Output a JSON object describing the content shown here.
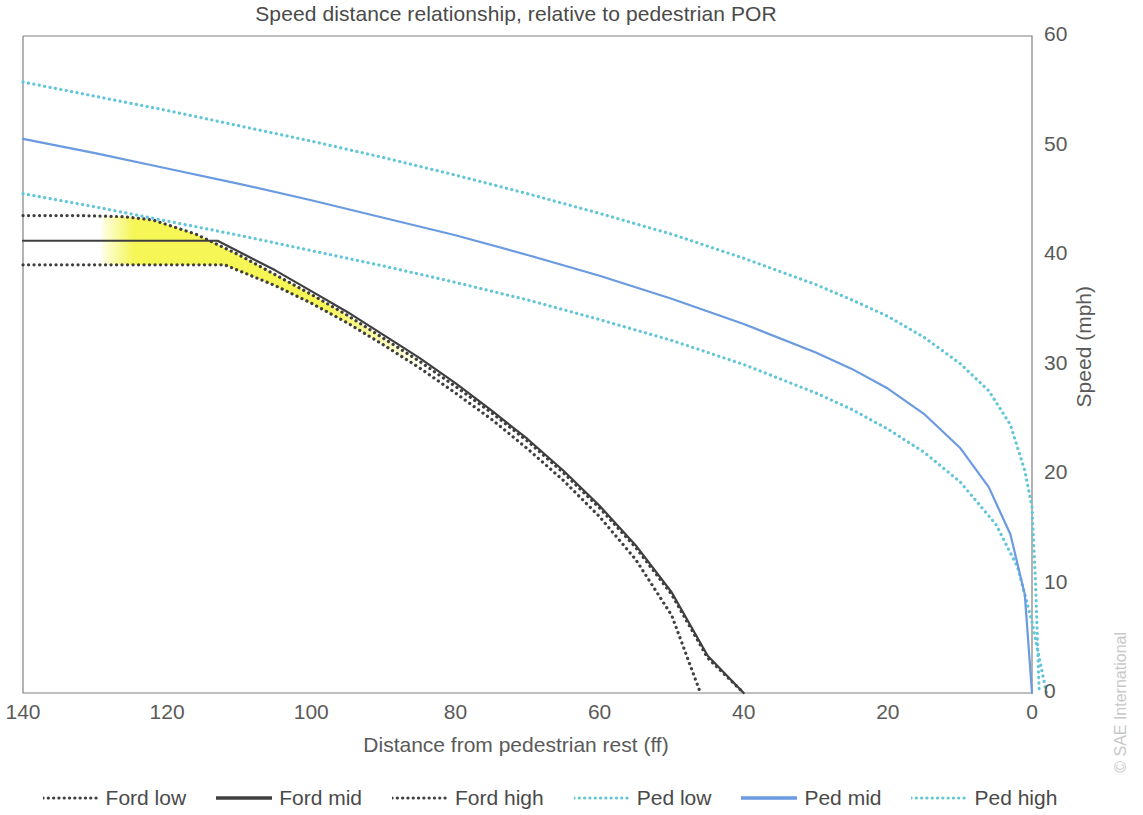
{
  "chart_data": {
    "type": "line",
    "title": "Speed distance relationship, relative to pedestrian POR",
    "xlabel": "Distance from pedestrian rest (ff)",
    "ylabel": "Speed (mph)",
    "xlim": [
      140,
      0
    ],
    "ylim": [
      0,
      60
    ],
    "x_ticks": [
      140,
      120,
      100,
      80,
      60,
      40,
      20,
      0
    ],
    "y_ticks": [
      0,
      10,
      20,
      30,
      40,
      50,
      60
    ],
    "x_axis_reversed": true,
    "grid": false,
    "legend_position": "bottom",
    "colors": {
      "ford": "#3f3f3f",
      "ped_mid": "#6a9ae0",
      "ped_bounds": "#62c6d8",
      "highlight_band": "#f5f54d",
      "axis": "#808080",
      "text": "#595959"
    },
    "highlight_band": {
      "label": "uncertainty-highlight",
      "color": "#f5f54d",
      "x_start": 129,
      "x_end": 85
    },
    "series": [
      {
        "name": "Ford low",
        "style": "dotted",
        "color": "#3f3f3f",
        "points": [
          [
            140,
            39.1
          ],
          [
            130,
            39.1
          ],
          [
            120,
            39.1
          ],
          [
            112,
            39.1
          ],
          [
            105,
            37.2
          ],
          [
            100,
            35.6
          ],
          [
            95,
            33.8
          ],
          [
            90,
            31.8
          ],
          [
            85,
            29.7
          ],
          [
            80,
            27.4
          ],
          [
            75,
            25.0
          ],
          [
            70,
            22.3
          ],
          [
            65,
            19.4
          ],
          [
            60,
            16.1
          ],
          [
            55,
            12.2
          ],
          [
            50,
            7.1
          ],
          [
            46,
            0
          ]
        ]
      },
      {
        "name": "Ford mid",
        "style": "solid",
        "color": "#3f3f3f",
        "points": [
          [
            140,
            41.3
          ],
          [
            130,
            41.3
          ],
          [
            122,
            41.3
          ],
          [
            113,
            41.3
          ],
          [
            105,
            38.6
          ],
          [
            100,
            36.7
          ],
          [
            95,
            34.8
          ],
          [
            90,
            32.7
          ],
          [
            85,
            30.6
          ],
          [
            80,
            28.3
          ],
          [
            75,
            25.8
          ],
          [
            70,
            23.2
          ],
          [
            65,
            20.3
          ],
          [
            60,
            17.1
          ],
          [
            55,
            13.5
          ],
          [
            50,
            9.2
          ],
          [
            45,
            3.4
          ],
          [
            40,
            0
          ]
        ]
      },
      {
        "name": "Ford high",
        "style": "dotted",
        "color": "#3f3f3f",
        "points": [
          [
            140,
            43.6
          ],
          [
            132,
            43.6
          ],
          [
            126,
            43.5
          ],
          [
            122,
            43.2
          ],
          [
            116,
            41.9
          ],
          [
            110,
            40.0
          ],
          [
            105,
            38.2
          ],
          [
            100,
            36.4
          ],
          [
            95,
            34.5
          ],
          [
            90,
            32.4
          ],
          [
            85,
            30.3
          ],
          [
            80,
            28.0
          ],
          [
            75,
            25.6
          ],
          [
            70,
            23.0
          ],
          [
            65,
            20.1
          ],
          [
            60,
            16.9
          ],
          [
            55,
            13.3
          ],
          [
            50,
            9.0
          ],
          [
            45,
            3.2
          ],
          [
            40,
            0
          ]
        ]
      },
      {
        "name": "Ped low",
        "style": "dotted",
        "color": "#62c6d8",
        "points": [
          [
            140,
            45.6
          ],
          [
            130,
            44.4
          ],
          [
            120,
            43.1
          ],
          [
            110,
            41.8
          ],
          [
            100,
            40.4
          ],
          [
            90,
            39.0
          ],
          [
            80,
            37.5
          ],
          [
            70,
            35.9
          ],
          [
            60,
            34.1
          ],
          [
            50,
            32.2
          ],
          [
            40,
            30.0
          ],
          [
            30,
            27.4
          ],
          [
            25,
            25.9
          ],
          [
            20,
            24.1
          ],
          [
            15,
            22.0
          ],
          [
            10,
            19.3
          ],
          [
            5,
            15.4
          ],
          [
            2,
            11.5
          ],
          [
            0,
            6.5
          ],
          [
            -2,
            0
          ]
        ]
      },
      {
        "name": "Ped mid",
        "style": "solid",
        "color": "#6a9ae0",
        "points": [
          [
            140,
            50.6
          ],
          [
            130,
            49.3
          ],
          [
            120,
            47.9
          ],
          [
            110,
            46.5
          ],
          [
            100,
            45.0
          ],
          [
            90,
            43.4
          ],
          [
            80,
            41.8
          ],
          [
            70,
            40.0
          ],
          [
            60,
            38.1
          ],
          [
            50,
            36.0
          ],
          [
            40,
            33.7
          ],
          [
            30,
            31.1
          ],
          [
            25,
            29.6
          ],
          [
            20,
            27.8
          ],
          [
            15,
            25.5
          ],
          [
            10,
            22.4
          ],
          [
            6,
            18.8
          ],
          [
            3,
            14.5
          ],
          [
            1,
            9.0
          ],
          [
            0,
            0
          ]
        ]
      },
      {
        "name": "Ped high",
        "style": "dotted",
        "color": "#62c6d8",
        "points": [
          [
            140,
            55.8
          ],
          [
            130,
            54.5
          ],
          [
            120,
            53.2
          ],
          [
            110,
            51.8
          ],
          [
            100,
            50.4
          ],
          [
            90,
            48.9
          ],
          [
            80,
            47.3
          ],
          [
            70,
            45.6
          ],
          [
            60,
            43.8
          ],
          [
            50,
            41.9
          ],
          [
            40,
            39.7
          ],
          [
            30,
            37.3
          ],
          [
            25,
            35.9
          ],
          [
            20,
            34.4
          ],
          [
            15,
            32.5
          ],
          [
            10,
            30.1
          ],
          [
            6,
            27.6
          ],
          [
            3,
            24.5
          ],
          [
            1,
            20.3
          ],
          [
            0,
            17.0
          ],
          [
            -0.5,
            10.0
          ],
          [
            -1,
            0
          ]
        ]
      }
    ]
  },
  "legend": {
    "items": [
      {
        "label": "Ford low",
        "style": "dotted",
        "color": "#3f3f3f"
      },
      {
        "label": "Ford mid",
        "style": "solid",
        "color": "#3f3f3f"
      },
      {
        "label": "Ford high",
        "style": "dotted",
        "color": "#3f3f3f"
      },
      {
        "label": "Ped low",
        "style": "dotted",
        "color": "#62c6d8"
      },
      {
        "label": "Ped mid",
        "style": "solid",
        "color": "#6a9ae0"
      },
      {
        "label": "Ped high",
        "style": "dotted",
        "color": "#62c6d8"
      }
    ]
  },
  "watermark": "© SAE International"
}
